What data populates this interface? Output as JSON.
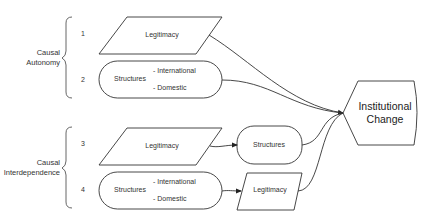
{
  "groups": [
    {
      "label_line1": "Causal",
      "label_line2": "Autonomy"
    },
    {
      "label_line1": "Causal",
      "label_line2": "Interdependence"
    }
  ],
  "rows": [
    {
      "number": "1",
      "shape": "parallelogram",
      "label": "Legitimacy"
    },
    {
      "number": "2",
      "shape": "stadium",
      "label": "Structures",
      "sub_items": [
        "- International",
        "- Domestic"
      ]
    },
    {
      "number": "3",
      "shape": "parallelogram",
      "label": "Legitimacy",
      "next": {
        "shape": "stadium",
        "label": "Structures"
      }
    },
    {
      "number": "4",
      "shape": "stadium",
      "label": "Structures",
      "sub_items": [
        "- International",
        "- Domestic"
      ],
      "next": {
        "shape": "parallelogram",
        "label": "Legitimacy"
      }
    }
  ],
  "outcome": {
    "shape": "display",
    "label_line1": "Institutional",
    "label_line2": "Change"
  },
  "colors": {
    "stroke": "#333333",
    "text": "#333333",
    "background": "#ffffff"
  }
}
